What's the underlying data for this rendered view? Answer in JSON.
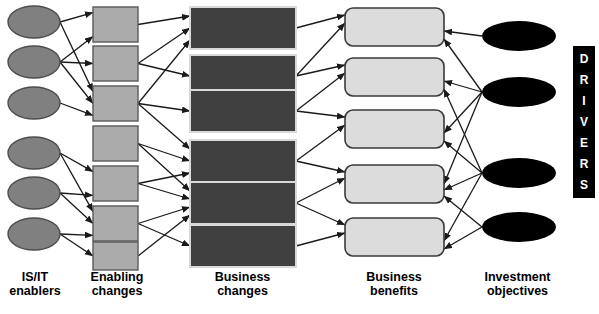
{
  "diagram": {
    "canvas": {
      "width": 599,
      "height": 314
    },
    "colors": {
      "enabler_fill": "#808080",
      "enabler_stroke": "#4d4d4d",
      "enabling_change_fill": "#ababab",
      "enabling_change_stroke": "#5a5a5a",
      "business_change_fill": "#404040",
      "business_change_stroke": "#d9d9d9",
      "business_benefit_fill": "#dcdcdc",
      "business_benefit_stroke": "#3a3a3a",
      "investment_objective_fill": "#000000",
      "arrow_color": "#1a1a1a",
      "drivers_bar_fill": "#000000",
      "drivers_text": "#ffffff"
    },
    "columns": [
      {
        "id": "is-it-enablers",
        "label_line1": "IS/IT",
        "label_line2": "enablers",
        "shape": "ellipse",
        "count": 6
      },
      {
        "id": "enabling-changes",
        "label_line1": "Enabling",
        "label_line2": "changes",
        "shape": "rectangle",
        "count": 6
      },
      {
        "id": "business-changes",
        "label_line1": "Business",
        "label_line2": "changes",
        "shape": "rectangle",
        "count": 6
      },
      {
        "id": "business-benefits",
        "label_line1": "Business",
        "label_line2": "benefits",
        "shape": "rounded-rectangle",
        "count": 5
      },
      {
        "id": "investment-objectives",
        "label_line1": "Investment",
        "label_line2": "objectives",
        "shape": "ellipse",
        "count": 4
      }
    ],
    "drivers": {
      "label": "DRIVERS",
      "letters": [
        "D",
        "R",
        "I",
        "V",
        "E",
        "R",
        "S"
      ],
      "orientation": "vertical"
    },
    "nodes": {
      "enablers": [
        {
          "id": "e1",
          "cx": 34,
          "cy": 22,
          "rx": 26,
          "ry": 16
        },
        {
          "id": "e2",
          "cx": 34,
          "cy": 62,
          "rx": 26,
          "ry": 16
        },
        {
          "id": "e3",
          "cx": 34,
          "cy": 103,
          "rx": 26,
          "ry": 16
        },
        {
          "id": "e4",
          "cx": 34,
          "cy": 153,
          "rx": 26,
          "ry": 16
        },
        {
          "id": "e5",
          "cx": 34,
          "cy": 193,
          "rx": 26,
          "ry": 16
        },
        {
          "id": "e6",
          "cx": 34,
          "cy": 234,
          "rx": 26,
          "ry": 16
        }
      ],
      "enabling_changes": [
        {
          "id": "ec1",
          "x": 93,
          "y": 7,
          "w": 45,
          "h": 35
        },
        {
          "id": "ec2",
          "x": 93,
          "y": 46,
          "w": 45,
          "h": 35
        },
        {
          "id": "ec3",
          "x": 93,
          "y": 86,
          "w": 45,
          "h": 35
        },
        {
          "id": "ec4",
          "x": 93,
          "y": 126,
          "w": 45,
          "h": 35
        },
        {
          "id": "ec5",
          "x": 93,
          "y": 166,
          "w": 45,
          "h": 35
        },
        {
          "id": "ec6",
          "x": 93,
          "y": 206,
          "w": 45,
          "h": 35
        },
        {
          "id": "ec7",
          "x": 93,
          "y": 242,
          "w": 45,
          "h": 28
        }
      ],
      "business_changes": [
        {
          "id": "bc1",
          "x": 190,
          "y": 7,
          "w": 106,
          "h": 42
        },
        {
          "id": "bc2",
          "x": 190,
          "y": 55,
          "w": 106,
          "h": 42
        },
        {
          "id": "bc3",
          "x": 190,
          "y": 90,
          "w": 106,
          "h": 42
        },
        {
          "id": "bc4",
          "x": 190,
          "y": 140,
          "w": 106,
          "h": 42
        },
        {
          "id": "bc5",
          "x": 190,
          "y": 182,
          "w": 106,
          "h": 42
        },
        {
          "id": "bc6",
          "x": 190,
          "y": 225,
          "w": 106,
          "h": 42
        }
      ],
      "business_benefits": [
        {
          "id": "bb1",
          "x": 345,
          "y": 8,
          "w": 99,
          "h": 38,
          "r": 8
        },
        {
          "id": "bb2",
          "x": 345,
          "y": 58,
          "w": 99,
          "h": 38,
          "r": 8
        },
        {
          "id": "bb3",
          "x": 345,
          "y": 110,
          "w": 99,
          "h": 38,
          "r": 8
        },
        {
          "id": "bb4",
          "x": 345,
          "y": 165,
          "w": 99,
          "h": 38,
          "r": 8
        },
        {
          "id": "bb5",
          "x": 345,
          "y": 218,
          "w": 99,
          "h": 38,
          "r": 8
        }
      ],
      "investment_objectives": [
        {
          "id": "io1",
          "cx": 519,
          "cy": 36,
          "rx": 37,
          "ry": 15
        },
        {
          "id": "io2",
          "cx": 519,
          "cy": 92,
          "rx": 37,
          "ry": 15
        },
        {
          "id": "io3",
          "cx": 519,
          "cy": 173,
          "rx": 37,
          "ry": 15
        },
        {
          "id": "io4",
          "cx": 519,
          "cy": 227,
          "rx": 37,
          "ry": 15
        }
      ]
    },
    "edges": [
      {
        "from": "e1",
        "to": "ec1"
      },
      {
        "from": "e1",
        "to": "ec3"
      },
      {
        "from": "e2",
        "to": "ec1"
      },
      {
        "from": "e2",
        "to": "ec2"
      },
      {
        "from": "e2",
        "to": "ec3"
      },
      {
        "from": "e3",
        "to": "ec3"
      },
      {
        "from": "e4",
        "to": "ec5"
      },
      {
        "from": "e4",
        "to": "ec6"
      },
      {
        "from": "e5",
        "to": "ec5"
      },
      {
        "from": "e5",
        "to": "ec6"
      },
      {
        "from": "e6",
        "to": "ec6"
      },
      {
        "from": "e6",
        "to": "ec7"
      },
      {
        "from": "ec1",
        "to": "bc1"
      },
      {
        "from": "ec2",
        "to": "bc1"
      },
      {
        "from": "ec2",
        "to": "bc2"
      },
      {
        "from": "ec3",
        "to": "bc1"
      },
      {
        "from": "ec3",
        "to": "bc3"
      },
      {
        "from": "ec3",
        "to": "bc4"
      },
      {
        "from": "ec4",
        "to": "bc4"
      },
      {
        "from": "ec4",
        "to": "bc5"
      },
      {
        "from": "ec5",
        "to": "bc4"
      },
      {
        "from": "ec5",
        "to": "bc5"
      },
      {
        "from": "ec6",
        "to": "bc5"
      },
      {
        "from": "ec6",
        "to": "bc6"
      },
      {
        "from": "ec7",
        "to": "bc5"
      },
      {
        "from": "bc1",
        "to": "bb1"
      },
      {
        "from": "bc2",
        "to": "bb1"
      },
      {
        "from": "bc2",
        "to": "bb2"
      },
      {
        "from": "bc3",
        "to": "bb2"
      },
      {
        "from": "bc3",
        "to": "bb3"
      },
      {
        "from": "bc4",
        "to": "bb3"
      },
      {
        "from": "bc4",
        "to": "bb4"
      },
      {
        "from": "bc5",
        "to": "bb4"
      },
      {
        "from": "bc5",
        "to": "bb5"
      },
      {
        "from": "bc6",
        "to": "bb5"
      },
      {
        "from": "io1",
        "to": "bb1"
      },
      {
        "from": "io2",
        "to": "bb1"
      },
      {
        "from": "io2",
        "to": "bb2"
      },
      {
        "from": "io2",
        "to": "bb3"
      },
      {
        "from": "io2",
        "to": "bb4"
      },
      {
        "from": "io3",
        "to": "bb2"
      },
      {
        "from": "io3",
        "to": "bb3"
      },
      {
        "from": "io3",
        "to": "bb4"
      },
      {
        "from": "io3",
        "to": "bb5"
      },
      {
        "from": "io4",
        "to": "bb4"
      },
      {
        "from": "io4",
        "to": "bb5"
      }
    ]
  }
}
